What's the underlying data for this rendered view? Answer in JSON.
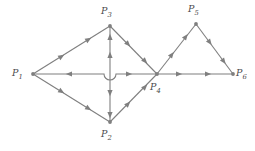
{
  "figure": {
    "type": "directed-graph-diagram",
    "background_color": "#ffffff",
    "line_color": "#7f7f7f",
    "label_color": "#4a4a4a"
  },
  "vertices": [
    {
      "id": "P1",
      "name": "P",
      "subscript": "1",
      "x": 33,
      "y": 74,
      "label_x": 12,
      "label_y": 68
    },
    {
      "id": "P2",
      "name": "P",
      "subscript": "2",
      "x": 110,
      "y": 122,
      "label_x": 101,
      "label_y": 129
    },
    {
      "id": "P3",
      "name": "P",
      "subscript": "3",
      "x": 110,
      "y": 26,
      "label_x": 101,
      "label_y": 6
    },
    {
      "id": "P4",
      "name": "P",
      "subscript": "4",
      "x": 157,
      "y": 74,
      "label_x": 150,
      "label_y": 82
    },
    {
      "id": "P5",
      "name": "P",
      "subscript": "5",
      "x": 196,
      "y": 24,
      "label_x": 188,
      "label_y": 4
    },
    {
      "id": "P6",
      "name": "P",
      "subscript": "6",
      "x": 233,
      "y": 74,
      "label_x": 236,
      "label_y": 68
    }
  ],
  "edges": [
    {
      "id": "e1",
      "from": "P1",
      "to": "P3",
      "arrow_count": 2,
      "direction": "up-right"
    },
    {
      "id": "e2",
      "from": "P1",
      "to": "P2",
      "arrow_count": 2,
      "direction": "down-right"
    },
    {
      "id": "e3",
      "from": "P3",
      "to": "P4",
      "arrow_count": 2,
      "direction": "down-right"
    },
    {
      "id": "e4",
      "from": "P2",
      "to": "P4",
      "arrow_count": 2,
      "direction": "up-right"
    },
    {
      "id": "e5",
      "from": "P3",
      "to": "P2",
      "arrow_count": 2,
      "direction": "vertical",
      "note": "split by hop at horizontal crossing"
    },
    {
      "id": "e6",
      "from": "P4",
      "to": "P1",
      "arrow_count": 1,
      "direction": "left",
      "note": "left of hop, arrow points left"
    },
    {
      "id": "e7",
      "from": "P4",
      "to": "P6",
      "arrow_count": 2,
      "direction": "right"
    },
    {
      "id": "e8",
      "from": "P4",
      "to": "P5",
      "arrow_count": 2,
      "direction": "up-right"
    },
    {
      "id": "e9",
      "from": "P5",
      "to": "P6",
      "arrow_count": 2,
      "direction": "down-right"
    }
  ],
  "crossing_hop": {
    "name": "wire-hop-arc",
    "x": 110,
    "y": 74,
    "radius": 6,
    "style": "horizontal line dips below vertical line"
  }
}
